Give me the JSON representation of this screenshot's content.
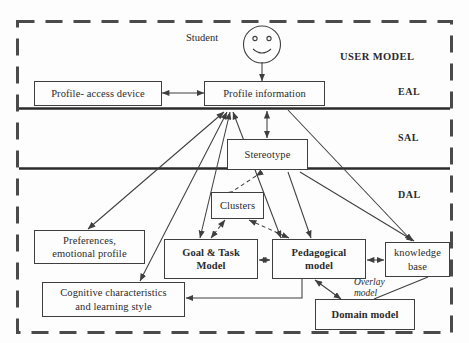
{
  "diagram": {
    "title": "USER MODEL",
    "colors": {
      "background": "#fdfdfd",
      "stroke": "#3f3f3f",
      "text": "#2b2b2b",
      "dashed_border": "#4a4a4a",
      "divider": "#2b2b2b"
    },
    "outer_frame": {
      "style": "dashed",
      "label": "user-model-boundary"
    }
  },
  "layers": [
    {
      "id": "eal",
      "label": "EAL"
    },
    {
      "id": "sal",
      "label": "SAL"
    },
    {
      "id": "dal",
      "label": "DAL"
    }
  ],
  "actor": {
    "label": "Student",
    "icon": "smiley-face-icon"
  },
  "nodes": [
    {
      "id": "profile-access-device",
      "label": "Profile- access device",
      "bold": false
    },
    {
      "id": "profile-information",
      "label": "Profile information",
      "bold": false
    },
    {
      "id": "stereotype",
      "label": "Stereotype",
      "bold": false
    },
    {
      "id": "clusters",
      "label": "Clusters",
      "bold": false
    },
    {
      "id": "preferences",
      "label": "Preferences,\nemotional profile",
      "bold": false
    },
    {
      "id": "cognitive",
      "label": "Cognitive characteristics\nand learning style",
      "bold": false
    },
    {
      "id": "goal-task-model",
      "label": "Goal & Task\nModel",
      "bold": true
    },
    {
      "id": "pedagogical-model",
      "label": "Pedagogical\nmodel",
      "bold": true
    },
    {
      "id": "knowledge-base",
      "label": "knowledge\nbase",
      "bold": false
    },
    {
      "id": "domain-model",
      "label": "Domain model",
      "bold": true
    }
  ],
  "annotations": [
    {
      "id": "overlay-model",
      "label": "Overlay\nmodel",
      "style": "italic"
    }
  ],
  "edges": [
    {
      "from": "student",
      "to": "profile-information",
      "arrows": "one",
      "style": "solid"
    },
    {
      "from": "profile-access-device",
      "to": "profile-information",
      "arrows": "both",
      "style": "solid"
    },
    {
      "from": "profile-information",
      "to": "stereotype",
      "arrows": "both",
      "style": "solid"
    },
    {
      "from": "profile-information",
      "to": "preferences",
      "arrows": "both",
      "style": "solid"
    },
    {
      "from": "profile-information",
      "to": "cognitive",
      "arrows": "both",
      "style": "solid"
    },
    {
      "from": "profile-information",
      "to": "goal-task-model",
      "arrows": "both",
      "style": "solid"
    },
    {
      "from": "profile-information",
      "to": "pedagogical-model",
      "arrows": "both",
      "style": "solid"
    },
    {
      "from": "profile-information",
      "to": "knowledge-base",
      "arrows": "one",
      "style": "solid"
    },
    {
      "from": "stereotype",
      "to": "clusters",
      "arrows": "both",
      "style": "dashed"
    },
    {
      "from": "stereotype",
      "to": "knowledge-base",
      "arrows": "one",
      "style": "solid"
    },
    {
      "from": "stereotype",
      "to": "pedagogical-model",
      "arrows": "one",
      "style": "solid"
    },
    {
      "from": "clusters",
      "to": "goal-task-model",
      "arrows": "both",
      "style": "dashed"
    },
    {
      "from": "clusters",
      "to": "pedagogical-model",
      "arrows": "both",
      "style": "dashed"
    },
    {
      "from": "goal-task-model",
      "to": "pedagogical-model",
      "arrows": "both",
      "style": "solid"
    },
    {
      "from": "pedagogical-model",
      "to": "knowledge-base",
      "arrows": "both",
      "style": "solid"
    },
    {
      "from": "pedagogical-model",
      "to": "cognitive",
      "arrows": "one",
      "style": "solid"
    },
    {
      "from": "pedagogical-model",
      "to": "domain-model",
      "arrows": "both",
      "style": "solid"
    },
    {
      "from": "domain-model",
      "to": "knowledge-base",
      "arrows": "both",
      "style": "solid"
    }
  ]
}
